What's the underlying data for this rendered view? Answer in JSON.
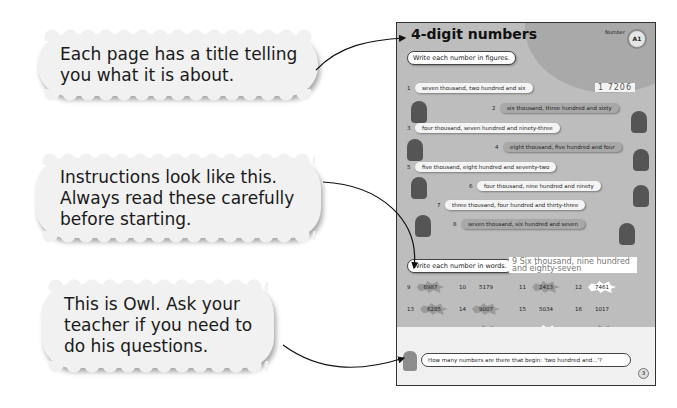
{
  "callouts": [
    {
      "text_lines": [
        "Each page has a title telling",
        "you what it is about."
      ]
    },
    {
      "text_lines": [
        "Instructions look like this.",
        "Always read these carefully",
        "before starting."
      ]
    },
    {
      "text_lines": [
        "This is Owl. Ask your",
        "teacher if you need to",
        "do his questions."
      ]
    }
  ],
  "page": {
    "title": "4-digit numbers",
    "strand": "Number",
    "badge": "A1",
    "instruction_1": "Write each number in figures.",
    "example_answer_label": "1",
    "example_answer": "7206",
    "questions": [
      {
        "num": "1",
        "text": "seven thousand, two hundred and six",
        "style": "light"
      },
      {
        "num": "2",
        "text": "six thousand, three hundred and sixty",
        "style": "dark"
      },
      {
        "num": "3",
        "text": "four thousand, seven hundred and ninety-three",
        "style": "light"
      },
      {
        "num": "4",
        "text": "eight thousand, five hundred and four",
        "style": "dark"
      },
      {
        "num": "5",
        "text": "five thousand, eight hundred and seventy-two",
        "style": "light"
      },
      {
        "num": "6",
        "text": "four thousand, nine hundred and ninety",
        "style": "light"
      },
      {
        "num": "7",
        "text": "three thousand, four hundred and thirty-three",
        "style": "light"
      },
      {
        "num": "8",
        "text": "seven thousand, six hundred and seven",
        "style": "dark"
      }
    ],
    "instruction_2": "Write each number in words.",
    "words_answer_label": "9",
    "words_answer": "Six thousand, nine hundred and eighty-seven",
    "numbers": [
      {
        "num": "9",
        "value": "6987",
        "star": "grey"
      },
      {
        "num": "10",
        "value": "5179",
        "star": "none"
      },
      {
        "num": "11",
        "value": "2413",
        "star": "grey"
      },
      {
        "num": "12",
        "value": "7461",
        "star": "white"
      },
      {
        "num": "13",
        "value": "6285",
        "star": "grey"
      },
      {
        "num": "14",
        "value": "9007",
        "star": "grey"
      },
      {
        "num": "15",
        "value": "5034",
        "star": "none"
      },
      {
        "num": "16",
        "value": "1017",
        "star": "none"
      },
      {
        "num": "17",
        "value": "6938",
        "star": "none"
      },
      {
        "num": "18",
        "value": "4683",
        "star": "grey"
      },
      {
        "num": "19",
        "value": "2171",
        "star": "white"
      },
      {
        "num": "20",
        "value": "4728",
        "star": "grey"
      }
    ],
    "owl_question": "How many numbers are there that begin: 'two hundred and...'?",
    "page_number": "3"
  }
}
